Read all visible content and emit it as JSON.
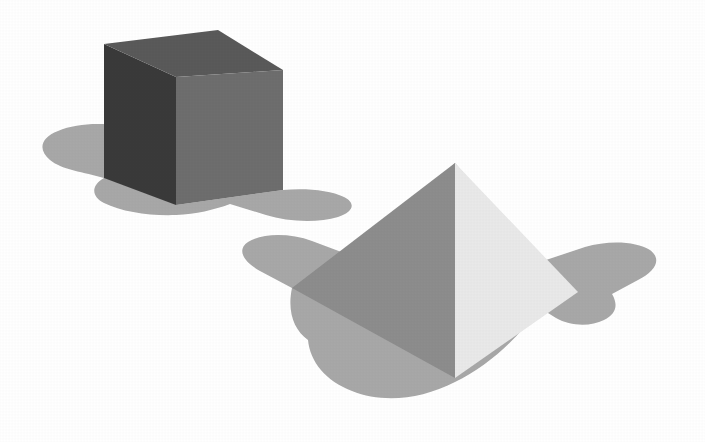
{
  "scene": {
    "title": "Two 3D solids on a white background",
    "background_color": "#ffffff",
    "width": 705,
    "height": 442,
    "object_count": "2"
  },
  "palette": {
    "cube_left_face": "#3a3a3a",
    "cube_top_face": "#5a5a5a",
    "cube_right_face": "#6e6e6e",
    "pyramid_left_face": "#8d8d8d",
    "pyramid_right_face": "#e9e9e9",
    "shadow": "#a8a8a8",
    "background": "#ffffff"
  },
  "objects": [
    {
      "name": "cube",
      "label": "Dark grey cube",
      "faces": [
        {
          "name": "left-face",
          "label": "Left face (shadowed)",
          "color": "#3a3a3a",
          "points": "104,44 176,77 176,205 104,178"
        },
        {
          "name": "top-face",
          "label": "Top face",
          "color": "#5a5a5a",
          "points": "104,44 218,30 283,70 176,77"
        },
        {
          "name": "right-face",
          "label": "Right face (lit)",
          "color": "#6e6e6e",
          "points": "176,77 283,70 283,190 176,205"
        }
      ],
      "shadow": {
        "name": "cube-shadow",
        "label": "Cast shadow under cube",
        "color": "#a8a8a8",
        "path": "M 104,178 C 84,172 62,170 50,160 C 38,150 40,138 58,131 C 80,122 112,122 136,130 L 176,143 L 176,205 L 283,190 C 305,188 330,190 344,197 C 356,203 354,212 338,217 C 318,223 288,222 266,215 L 230,204 C 214,210 196,214 176,215 C 150,216 122,212 104,203 C 92,197 90,186 104,178 Z"
      }
    },
    {
      "name": "pyramid",
      "label": "Light grey square pyramid",
      "faces": [
        {
          "name": "left-face",
          "label": "Left face (shadowed)",
          "color": "#8d8d8d",
          "points": "455,163 455,378 292,288"
        },
        {
          "name": "right-face",
          "label": "Right face (lit)",
          "color": "#e9e9e9",
          "points": "455,163 578,292 455,378"
        }
      ],
      "shadow": {
        "name": "pyramid-shadow",
        "label": "Cast shadow under pyramid",
        "color": "#a8a8a8",
        "path": "M 292,288 L 260,271 C 244,262 236,250 248,242 C 262,233 290,233 312,241 L 360,259 L 455,163 L 540,262 L 585,247 C 608,240 636,241 650,250 C 662,259 656,271 638,280 L 612,294 C 618,304 617,314 604,320 C 590,327 570,326 556,318 L 540,308 C 516,340 488,366 455,382 C 420,400 382,403 352,391 C 326,381 310,362 308,340 C 294,330 287,312 292,288 Z"
      }
    }
  ]
}
